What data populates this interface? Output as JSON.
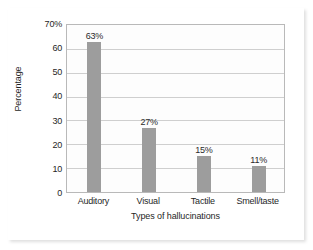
{
  "chart_data": {
    "type": "bar",
    "title": "",
    "categories": [
      "Auditory",
      "Visual",
      "Tactile",
      "Smell/taste"
    ],
    "values": [
      63,
      27,
      15,
      11
    ],
    "data_labels": [
      "63%",
      "27%",
      "15%",
      "11%"
    ],
    "xlabel": "Types of hallucinations",
    "ylabel": "Percentage",
    "ylim": [
      0,
      70
    ],
    "ytick_values": [
      0,
      10,
      20,
      30,
      40,
      50,
      60,
      70
    ],
    "ytick_labels": [
      "0",
      "10",
      "20",
      "30",
      "40",
      "50",
      "60",
      "70%"
    ],
    "grid": true,
    "legend": "none",
    "bar_color": "#9d9d9d",
    "grid_color": "#cfcfcf",
    "frame_color": "#b9b9b9",
    "plot_background": "#fdfdfd"
  }
}
